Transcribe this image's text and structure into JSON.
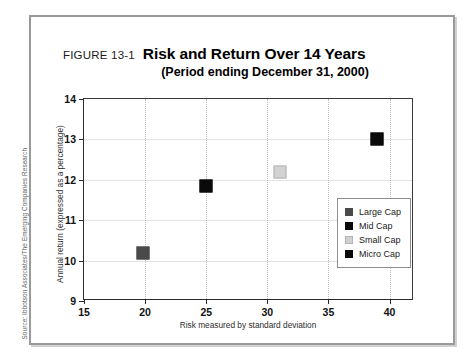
{
  "figure": {
    "number_label": "FIGURE 13-1",
    "title": "Risk and Return Over 14 Years",
    "subtitle": "(Period ending December 31, 2000)",
    "source": "Source: Ibbotson Associates/The Emerging Companies Research"
  },
  "colors": {
    "large_cap": "#4a4a4a",
    "mid_cap": "#0a0a0a",
    "small_cap": "#d2d2d2",
    "micro_cap": "#0a0a0a",
    "axis": "#2b2b2b",
    "gridline_h": "#e3e3e3",
    "gridline_v": "#bdbdbd",
    "frame": "#9a9a9a"
  },
  "chart_data": {
    "type": "scatter",
    "title": "Risk and Return Over 14 Years",
    "subtitle": "(Period ending December 31, 2000)",
    "xlabel": "Risk measured by standard deviation",
    "ylabel": "Annual return (expressed as a percentage)",
    "xlim": [
      15,
      42
    ],
    "ylim": [
      9,
      14
    ],
    "xticks": [
      15,
      20,
      25,
      30,
      35,
      40
    ],
    "yticks": [
      9,
      10,
      11,
      12,
      13,
      14
    ],
    "grid": "vertical dotted, horizontal solid light",
    "legend_position": "inside lower-right",
    "series": [
      {
        "name": "Large Cap",
        "x": 19.8,
        "y": 10.2,
        "color": "#4a4a4a",
        "marker": "square"
      },
      {
        "name": "Mid Cap",
        "x": 25.0,
        "y": 11.85,
        "color": "#0a0a0a",
        "marker": "square"
      },
      {
        "name": "Small Cap",
        "x": 31.0,
        "y": 12.2,
        "color": "#d2d2d2",
        "marker": "square"
      },
      {
        "name": "Micro Cap",
        "x": 39.0,
        "y": 13.0,
        "color": "#0a0a0a",
        "marker": "square"
      }
    ]
  },
  "legend": {
    "items": [
      {
        "label": "Large Cap",
        "color": "#4a4a4a"
      },
      {
        "label": "Mid Cap",
        "color": "#0a0a0a"
      },
      {
        "label": "Small Cap",
        "color": "#d2d2d2"
      },
      {
        "label": "Micro Cap",
        "color": "#0a0a0a"
      }
    ]
  }
}
